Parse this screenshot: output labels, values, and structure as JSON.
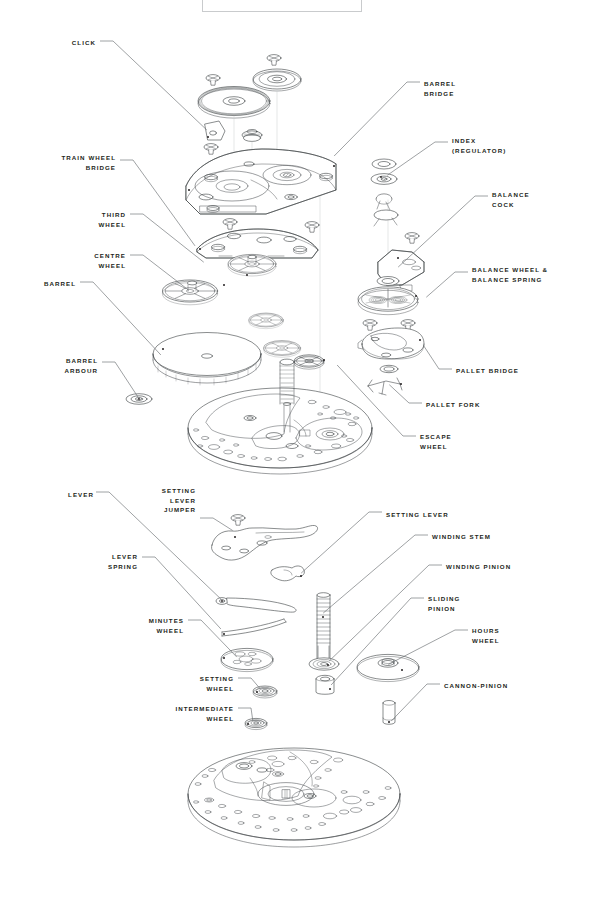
{
  "diagram": {
    "title_box_visible": true,
    "ink_color": "#3b3f42",
    "text_color": "#231f20",
    "background": "#ffffff"
  },
  "labels_left": [
    {
      "id": "click",
      "text": "CLICK",
      "x": 26,
      "y": 38,
      "align": "right",
      "w": 70
    },
    {
      "id": "train-wheel-bridge",
      "text": "TRAIN WHEEL\nBRIDGE",
      "x": 26,
      "y": 153,
      "align": "right",
      "w": 90
    },
    {
      "id": "third-wheel",
      "text": "THIRD\nWHEEL",
      "x": 56,
      "y": 210,
      "align": "right",
      "w": 70
    },
    {
      "id": "centre-wheel",
      "text": "CENTRE\nWHEEL",
      "x": 50,
      "y": 251,
      "align": "right",
      "w": 76
    },
    {
      "id": "barrel",
      "text": "BARREL",
      "x": 20,
      "y": 279,
      "align": "right",
      "w": 56
    },
    {
      "id": "barrel-arbour",
      "text": "BARREL\nARBOUR",
      "x": 22,
      "y": 356,
      "align": "right",
      "w": 76
    },
    {
      "id": "lever",
      "text": "LEVER",
      "x": 38,
      "y": 490,
      "align": "right",
      "w": 56
    },
    {
      "id": "setting-lever-jumper",
      "text": "SETTING\nLEVER\nJUMPER",
      "x": 128,
      "y": 486,
      "align": "right",
      "w": 68
    },
    {
      "id": "lever-spring",
      "text": "LEVER\nSPRING",
      "x": 70,
      "y": 552,
      "align": "right",
      "w": 68
    },
    {
      "id": "minutes-wheel",
      "text": "MINUTES\nWHEEL",
      "x": 112,
      "y": 616,
      "align": "right",
      "w": 72
    },
    {
      "id": "setting-wheel",
      "text": "SETTING\nWHEEL",
      "x": 162,
      "y": 674,
      "align": "right",
      "w": 72
    },
    {
      "id": "intermediate-wheel",
      "text": "INTERMEDIATE\nWHEEL",
      "x": 132,
      "y": 704,
      "align": "right",
      "w": 102
    }
  ],
  "labels_right": [
    {
      "id": "barrel-bridge",
      "text": "BARREL\nBRIDGE",
      "x": 424,
      "y": 79,
      "align": "left",
      "w": 120
    },
    {
      "id": "index-regulator",
      "text": "INDEX\n(REGULATOR)",
      "x": 452,
      "y": 136,
      "align": "left",
      "w": 130
    },
    {
      "id": "balance-cock",
      "text": "BALANCE\nCOCK",
      "x": 492,
      "y": 190,
      "align": "left",
      "w": 100
    },
    {
      "id": "balance-wheel-spring",
      "text": "BALANCE WHEEL &\nBALANCE SPRING",
      "x": 472,
      "y": 265,
      "align": "left",
      "w": 122
    },
    {
      "id": "pallet-bridge",
      "text": "PALLET BRIDGE",
      "x": 456,
      "y": 366,
      "align": "left",
      "w": 120
    },
    {
      "id": "pallet-fork",
      "text": "PALLET FORK",
      "x": 426,
      "y": 400,
      "align": "left",
      "w": 110
    },
    {
      "id": "escape-wheel",
      "text": "ESCAPE\nWHEEL",
      "x": 420,
      "y": 432,
      "align": "left",
      "w": 90
    },
    {
      "id": "setting-lever",
      "text": "SETTING LEVER",
      "x": 386,
      "y": 510,
      "align": "left",
      "w": 120
    },
    {
      "id": "winding-stem",
      "text": "WINDING STEM",
      "x": 432,
      "y": 532,
      "align": "left",
      "w": 120
    },
    {
      "id": "winding-pinion",
      "text": "WINDING PINION",
      "x": 446,
      "y": 562,
      "align": "left",
      "w": 126
    },
    {
      "id": "sliding-pinion",
      "text": "SLIDING\nPINION",
      "x": 428,
      "y": 594,
      "align": "left",
      "w": 90
    },
    {
      "id": "hours-wheel",
      "text": "HOURS\nWHEEL",
      "x": 472,
      "y": 626,
      "align": "left",
      "w": 90
    },
    {
      "id": "cannon-pinion",
      "text": "CANNON-PINION",
      "x": 444,
      "y": 681,
      "align": "left",
      "w": 124
    }
  ],
  "leaders": [
    {
      "id": "leader-click",
      "from": [
        100,
        41
      ],
      "to": [
        208,
        131
      ]
    },
    {
      "id": "leader-train-wheel-bridge",
      "from": [
        120,
        160
      ],
      "to": [
        196,
        247
      ]
    },
    {
      "id": "leader-third-wheel",
      "from": [
        130,
        214
      ],
      "to": [
        205,
        263
      ]
    },
    {
      "id": "leader-centre-wheel",
      "from": [
        130,
        255
      ],
      "to": [
        190,
        291
      ]
    },
    {
      "id": "leader-barrel",
      "from": [
        80,
        282
      ],
      "to": [
        162,
        356
      ]
    },
    {
      "id": "leader-barrel-arbour",
      "from": [
        102,
        362
      ],
      "to": [
        139,
        398
      ]
    },
    {
      "id": "leader-barrel-bridge",
      "from": [
        420,
        82
      ],
      "to": [
        333,
        157
      ]
    },
    {
      "id": "leader-index",
      "from": [
        448,
        142
      ],
      "to": [
        386,
        176
      ]
    },
    {
      "id": "leader-balance-cock",
      "from": [
        488,
        196
      ],
      "to": [
        397,
        268
      ]
    },
    {
      "id": "leader-balance-wheel",
      "from": [
        468,
        272
      ],
      "to": [
        425,
        298
      ]
    },
    {
      "id": "leader-pallet-bridge",
      "from": [
        452,
        369
      ],
      "to": [
        422,
        344
      ]
    },
    {
      "id": "leader-pallet-fork",
      "from": [
        422,
        403
      ],
      "to": [
        388,
        384
      ]
    },
    {
      "id": "leader-escape-wheel",
      "from": [
        416,
        436
      ],
      "to": [
        336,
        364
      ]
    },
    {
      "id": "leader-lever",
      "from": [
        96,
        492
      ],
      "to": [
        222,
        600
      ]
    },
    {
      "id": "leader-slj",
      "from": [
        200,
        518
      ],
      "to": [
        234,
        531
      ]
    },
    {
      "id": "leader-lever-spring",
      "from": [
        142,
        557
      ],
      "to": [
        222,
        630
      ]
    },
    {
      "id": "leader-minutes-wheel",
      "from": [
        188,
        620
      ],
      "to": [
        238,
        658
      ]
    },
    {
      "id": "leader-setting-wheel",
      "from": [
        238,
        678
      ],
      "to": [
        262,
        690
      ]
    },
    {
      "id": "leader-intermediate-wheel",
      "from": [
        238,
        708
      ],
      "to": [
        254,
        722
      ]
    },
    {
      "id": "leader-setting-lever",
      "from": [
        382,
        512
      ],
      "to": [
        300,
        574
      ]
    },
    {
      "id": "leader-winding-stem",
      "from": [
        428,
        535
      ],
      "to": [
        322,
        614
      ]
    },
    {
      "id": "leader-winding-pinion",
      "from": [
        442,
        565
      ],
      "to": [
        328,
        662
      ]
    },
    {
      "id": "leader-sliding-pinion",
      "from": [
        424,
        598
      ],
      "to": [
        330,
        686
      ]
    },
    {
      "id": "leader-hours-wheel",
      "from": [
        468,
        630
      ],
      "to": [
        387,
        665
      ]
    },
    {
      "id": "leader-cannon-pinion",
      "from": [
        440,
        684
      ],
      "to": [
        390,
        722
      ]
    }
  ]
}
